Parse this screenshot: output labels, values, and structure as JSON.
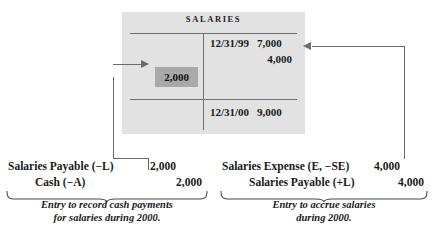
{
  "taccount": {
    "title": "SALARIES",
    "credit_rows": [
      {
        "date": "12/31/99",
        "amount": "7,000"
      },
      {
        "date": "",
        "amount": "4,000"
      },
      {
        "date": "12/31/00",
        "amount": "9,000"
      }
    ],
    "debit_highlight": {
      "amount": "2,000"
    }
  },
  "journal_left": {
    "lines": [
      {
        "account": "Salaries Payable (−L)",
        "amount": "2,000"
      },
      {
        "account": "Cash (−A)",
        "amount": "2,000"
      }
    ],
    "caption": {
      "line1": "Entry to record cash payments",
      "line2": "for salaries during 2000."
    }
  },
  "journal_right": {
    "lines": [
      {
        "account": "Salaries Expense (E, −SE)",
        "amount": "4,000"
      },
      {
        "account": "Salaries Payable (+L)",
        "amount": "4,000"
      }
    ],
    "caption": {
      "line1": "Entry to accrue salaries",
      "line2": "during 2000."
    }
  },
  "colors": {
    "panel_background": "#e2e2e2",
    "highlight_cell": "#a9a9a9",
    "rule": "#6f6f6f",
    "connector": "#6b6b6b",
    "text": "#1a1a1a",
    "page_background": "#ffffff"
  }
}
